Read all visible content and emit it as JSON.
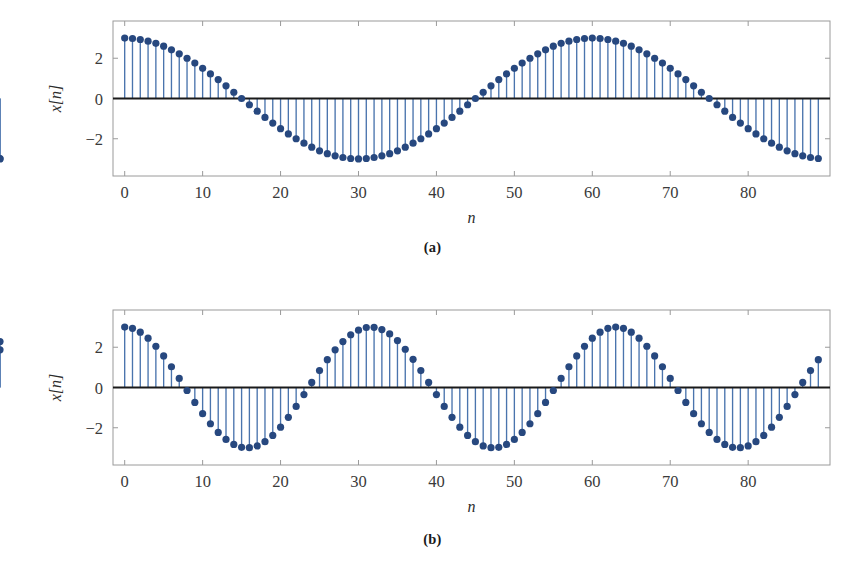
{
  "figure": {
    "title": "",
    "background": "#ffffff",
    "marker_color": "#27487F",
    "stem_color": "#4A74AD",
    "zero_line_color": "#1a1a1a",
    "frame_color": "#9a9a9a"
  },
  "panels": [
    {
      "id": "a",
      "caption": "(a)",
      "xlabel": "n",
      "ylabel": "x[n]"
    },
    {
      "id": "b",
      "caption": "(b)",
      "xlabel": "n",
      "ylabel": "x[n]"
    }
  ],
  "chart_data": [
    {
      "type": "line",
      "subtype": "stem",
      "panel": "a",
      "title": "(a)",
      "xlabel": "n",
      "ylabel": "x[n]",
      "xlim": [
        -1.5,
        90.5
      ],
      "ylim": [
        -3.85,
        3.85
      ],
      "xticks": [
        0,
        10,
        20,
        30,
        40,
        50,
        60,
        70,
        80
      ],
      "xticklabels": [
        "0",
        "10",
        "20",
        "30",
        "40",
        "50",
        "60",
        "70",
        "80"
      ],
      "yticks": [
        -2,
        0,
        2
      ],
      "yticklabels": [
        "−2",
        "0",
        "2"
      ],
      "grid": false,
      "legend": null,
      "formula": "x[n] = 3*cos(2*pi*n/60)",
      "amplitude": 3,
      "period": 60,
      "n_samples": 90,
      "x": [
        0,
        1,
        2,
        3,
        4,
        5,
        6,
        7,
        8,
        9,
        10,
        11,
        12,
        13,
        14,
        15,
        16,
        17,
        18,
        19,
        20,
        21,
        22,
        23,
        24,
        25,
        26,
        27,
        28,
        29,
        30,
        31,
        32,
        33,
        34,
        35,
        36,
        37,
        38,
        39,
        40,
        41,
        42,
        43,
        44,
        45,
        46,
        47,
        48,
        49,
        50,
        51,
        52,
        53,
        54,
        55,
        56,
        57,
        58,
        59,
        60,
        61,
        62,
        63,
        64,
        65,
        66,
        67,
        68,
        69,
        70,
        71,
        72,
        73,
        74,
        75,
        76,
        77,
        78,
        79,
        80,
        81,
        82,
        83,
        84,
        85,
        86,
        87,
        88,
        89
      ],
      "values": [
        3.0,
        2.98,
        2.93,
        2.85,
        2.74,
        2.6,
        2.42,
        2.22,
        2.0,
        1.76,
        1.5,
        1.22,
        0.94,
        0.63,
        0.31,
        0.0,
        -0.31,
        -0.63,
        -0.94,
        -1.22,
        -1.5,
        -1.76,
        -2.0,
        -2.22,
        -2.42,
        -2.6,
        -2.74,
        -2.85,
        -2.93,
        -2.98,
        -3.0,
        -2.98,
        -2.93,
        -2.85,
        -2.74,
        -2.6,
        -2.42,
        -2.22,
        -2.0,
        -1.76,
        -1.5,
        -1.22,
        -0.94,
        -0.63,
        -0.31,
        0.0,
        0.31,
        0.63,
        0.94,
        1.22,
        1.5,
        1.76,
        2.0,
        2.22,
        2.42,
        2.6,
        2.74,
        2.85,
        2.93,
        2.98,
        3.0,
        2.98,
        2.93,
        2.85,
        2.74,
        2.6,
        2.42,
        2.22,
        2.0,
        1.76,
        1.5,
        1.22,
        0.94,
        0.63,
        0.31,
        0.0,
        -0.31,
        -0.63,
        -0.94,
        -1.22,
        -1.5,
        -1.76,
        -2.0,
        -2.22,
        -2.42,
        -2.6,
        -2.74,
        -2.85,
        -2.93,
        -2.98,
        -3.0,
        -2.98
      ]
    },
    {
      "type": "line",
      "subtype": "stem",
      "panel": "b",
      "title": "(b)",
      "xlabel": "n",
      "ylabel": "x[n]",
      "xlim": [
        -1.5,
        90.5
      ],
      "ylim": [
        -3.85,
        3.85
      ],
      "xticks": [
        0,
        10,
        20,
        30,
        40,
        50,
        60,
        70,
        80
      ],
      "xticklabels": [
        "0",
        "10",
        "20",
        "30",
        "40",
        "50",
        "60",
        "70",
        "80"
      ],
      "yticks": [
        -2,
        0,
        2
      ],
      "yticklabels": [
        "−2",
        "0",
        "2"
      ],
      "grid": false,
      "legend": null,
      "formula": "x[n] = 3*cos(2*pi*n/31)",
      "amplitude": 3,
      "period": 31,
      "n_samples": 90,
      "x": [
        0,
        1,
        2,
        3,
        4,
        5,
        6,
        7,
        8,
        9,
        10,
        11,
        12,
        13,
        14,
        15,
        16,
        17,
        18,
        19,
        20,
        21,
        22,
        23,
        24,
        25,
        26,
        27,
        28,
        29,
        30,
        31,
        32,
        33,
        34,
        35,
        36,
        37,
        38,
        39,
        40,
        41,
        42,
        43,
        44,
        45,
        46,
        47,
        48,
        49,
        50,
        51,
        52,
        53,
        54,
        55,
        56,
        57,
        58,
        59,
        60,
        61,
        62,
        63,
        64,
        65,
        66,
        67,
        68,
        69,
        70,
        71,
        72,
        73,
        74,
        75,
        76,
        77,
        78,
        79,
        80,
        81,
        82,
        83,
        84,
        85,
        86,
        87,
        88,
        89
      ],
      "values": [
        3.0,
        2.94,
        2.75,
        2.45,
        2.05,
        1.57,
        1.03,
        0.45,
        -0.15,
        -0.74,
        -1.3,
        -1.8,
        -2.23,
        -2.58,
        -2.83,
        -2.97,
        -2.99,
        -2.9,
        -2.69,
        -2.38,
        -1.97,
        -1.48,
        -0.94,
        -0.35,
        0.25,
        0.84,
        1.38,
        1.87,
        2.28,
        2.62,
        2.85,
        2.98,
        2.99,
        2.88,
        2.66,
        2.33,
        1.9,
        1.4,
        0.84,
        0.25,
        -0.35,
        -0.94,
        -1.48,
        -1.97,
        -2.38,
        -2.69,
        -2.9,
        -2.99,
        -2.97,
        -2.83,
        -2.58,
        -2.23,
        -1.8,
        -1.3,
        -0.74,
        -0.15,
        0.45,
        1.03,
        1.57,
        2.05,
        2.45,
        2.75,
        2.94,
        3.0,
        2.94,
        2.75,
        2.45,
        2.05,
        1.57,
        1.03,
        0.45,
        -0.15,
        -0.74,
        -1.3,
        -1.8,
        -2.23,
        -2.58,
        -2.83,
        -2.97,
        -2.99,
        -2.9,
        -2.69,
        -2.38,
        -1.97,
        -1.48,
        -0.94,
        -0.35,
        0.25,
        0.84,
        1.38,
        1.87,
        2.28
      ]
    }
  ]
}
